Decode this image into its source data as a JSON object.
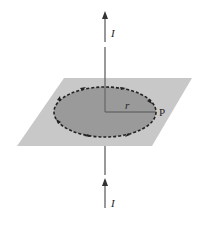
{
  "diagram": {
    "labels": {
      "current_top": "I",
      "current_bottom": "I",
      "radius": "r",
      "point": "P"
    },
    "colors": {
      "plane": "#c8c8c8",
      "disk": "#9a9a9a",
      "wire": "#6e6e6e",
      "loop": "#222222",
      "background": "#ffffff"
    },
    "elements": [
      "vertical wire with upward current I",
      "horizontal plane",
      "circular field line of radius r centered on wire",
      "point P on circle"
    ]
  }
}
